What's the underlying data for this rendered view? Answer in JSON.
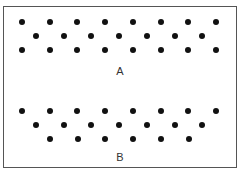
{
  "figures": [
    {
      "label": "A",
      "label_pos": [
        120,
        71
      ],
      "rows": [
        {
          "y": 22,
          "x_start": 22,
          "count": 8
        },
        {
          "y": 36,
          "x_start": 36,
          "count": 7
        },
        {
          "y": 50,
          "x_start": 22,
          "count": 8
        }
      ]
    },
    {
      "label": "B",
      "label_pos": [
        120,
        157
      ],
      "rows": [
        {
          "y": 111,
          "x_start": 22,
          "count": 8
        },
        {
          "y": 125,
          "x_start": 36,
          "count": 7
        },
        {
          "y": 139,
          "x_start": 50,
          "count": 6
        }
      ]
    }
  ],
  "dot_spacing": 27.7,
  "colors": {
    "dot": "#111111",
    "border": "#555555",
    "text": "#333333"
  }
}
